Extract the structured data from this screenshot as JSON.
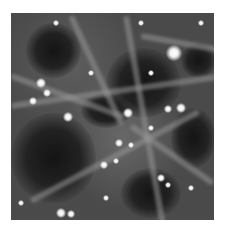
{
  "image": {
    "subject": "cosmic web dark matter simulation",
    "colors": {
      "void": "#161616",
      "filament": "#9a9a9a",
      "halo": "#ffffff",
      "background": "#ffffff"
    },
    "voids": [
      {
        "x": 95,
        "y": 35,
        "w": 75,
        "h": 70
      },
      {
        "x": 0,
        "y": 100,
        "w": 85,
        "h": 90
      },
      {
        "x": 15,
        "y": 10,
        "w": 55,
        "h": 55
      },
      {
        "x": 110,
        "y": 155,
        "w": 60,
        "h": 50
      },
      {
        "x": 160,
        "y": 95,
        "w": 45,
        "h": 60
      },
      {
        "x": 70,
        "y": 80,
        "w": 50,
        "h": 35
      },
      {
        "x": 170,
        "y": 30,
        "w": 35,
        "h": 35
      }
    ],
    "filaments": [
      {
        "x": 0,
        "y": 90,
        "len": 210,
        "rot": -8
      },
      {
        "x": 20,
        "y": 185,
        "len": 190,
        "rot": -28
      },
      {
        "x": 115,
        "y": 0,
        "len": 210,
        "rot": 80
      },
      {
        "x": 60,
        "y": 0,
        "len": 120,
        "rot": 65
      },
      {
        "x": 120,
        "y": 110,
        "len": 100,
        "rot": 35
      },
      {
        "x": 0,
        "y": 60,
        "len": 120,
        "rot": 20
      },
      {
        "x": 130,
        "y": 20,
        "len": 90,
        "rot": 10
      }
    ],
    "halos": [
      {
        "x": 163,
        "y": 40,
        "r": 8
      },
      {
        "x": 30,
        "y": 70,
        "r": 5
      },
      {
        "x": 36,
        "y": 80,
        "r": 4
      },
      {
        "x": 22,
        "y": 88,
        "r": 4
      },
      {
        "x": 57,
        "y": 104,
        "r": 5
      },
      {
        "x": 117,
        "y": 100,
        "r": 5
      },
      {
        "x": 170,
        "y": 95,
        "r": 5
      },
      {
        "x": 157,
        "y": 96,
        "r": 4
      },
      {
        "x": 108,
        "y": 130,
        "r": 4
      },
      {
        "x": 120,
        "y": 132,
        "r": 3
      },
      {
        "x": 105,
        "y": 148,
        "r": 3
      },
      {
        "x": 93,
        "y": 152,
        "r": 4
      },
      {
        "x": 150,
        "y": 165,
        "r": 4
      },
      {
        "x": 157,
        "y": 172,
        "r": 3
      },
      {
        "x": 50,
        "y": 200,
        "r": 5
      },
      {
        "x": 60,
        "y": 201,
        "r": 4
      },
      {
        "x": 130,
        "y": 10,
        "r": 3
      },
      {
        "x": 190,
        "y": 10,
        "r": 3
      },
      {
        "x": 45,
        "y": 10,
        "r": 3
      },
      {
        "x": 140,
        "y": 60,
        "r": 3
      },
      {
        "x": 80,
        "y": 60,
        "r": 3
      },
      {
        "x": 180,
        "y": 175,
        "r": 3
      },
      {
        "x": 95,
        "y": 185,
        "r": 3
      },
      {
        "x": 10,
        "y": 190,
        "r": 3
      },
      {
        "x": 140,
        "y": 115,
        "r": 3
      }
    ]
  }
}
